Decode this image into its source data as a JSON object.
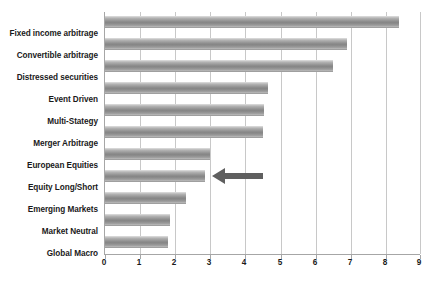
{
  "chart_data": {
    "type": "bar",
    "orientation": "horizontal",
    "title": "",
    "subtitle": "",
    "xlabel": "",
    "ylabel": "",
    "categories": [
      "Fixed income arbitrage",
      "Convertible arbitrage",
      "Distressed securities",
      "Event Driven",
      "Multi-Stategy",
      "Merger Arbitrage",
      "European Equities",
      "Equity Long/Short",
      "Emerging Markets",
      "Market Neutral",
      "Global Macro"
    ],
    "values": [
      8.4,
      6.9,
      6.5,
      4.65,
      4.55,
      4.5,
      3.0,
      2.85,
      2.3,
      1.85,
      1.8
    ],
    "xlim": [
      0,
      9
    ],
    "xticks": [
      0,
      1,
      2,
      3,
      4,
      5,
      6,
      7,
      8,
      9
    ],
    "xtick_labels": [
      "0",
      "1",
      "2",
      "3",
      "4",
      "5",
      "6",
      "7",
      "8",
      "9"
    ],
    "grid": "vertical",
    "legend": "none",
    "bar_color": "#8f8f8f",
    "grid_color": "#c8c8c8",
    "axis_color": "#a6a6a6",
    "annotations": [
      {
        "type": "arrow",
        "name": "equity-long-short-pointer",
        "points_to": "Equity Long/Short",
        "direction": "left",
        "color": "#5f5f5f",
        "x_start": 4.5,
        "x_end": 3.05
      }
    ]
  }
}
